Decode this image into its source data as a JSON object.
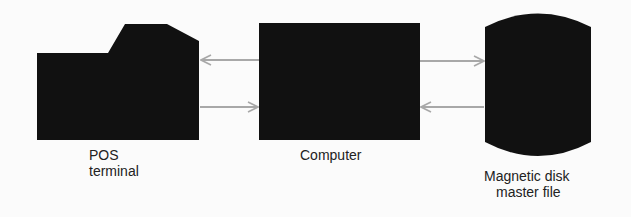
{
  "diagram": {
    "nodes": [
      {
        "id": "pos",
        "label_line1": "POS",
        "label_line2": "terminal"
      },
      {
        "id": "computer",
        "label": "Computer"
      },
      {
        "id": "disk",
        "label_line1": "Magnetic disk",
        "label_line2": "master file"
      }
    ],
    "edges": [
      {
        "from": "computer",
        "to": "pos"
      },
      {
        "from": "pos",
        "to": "computer"
      },
      {
        "from": "computer",
        "to": "disk"
      },
      {
        "from": "disk",
        "to": "computer"
      }
    ],
    "colors": {
      "shape": "#111111",
      "arrow": "#a8a8a8",
      "background": "#fbfbfb"
    }
  }
}
